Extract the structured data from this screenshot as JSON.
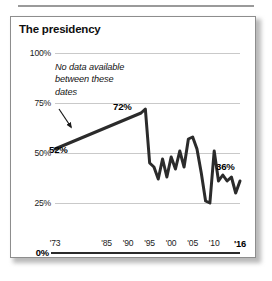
{
  "card": {
    "title": "The presidency"
  },
  "annotation": {
    "text": "No data available between these dates",
    "arrow": "arrow-down-right"
  },
  "chart_data": {
    "type": "line",
    "title": "The presidency",
    "xlabel": "",
    "ylabel": "",
    "ylim": [
      0,
      100
    ],
    "yticks": [
      "0%",
      "25%",
      "50%",
      "75%",
      "100%"
    ],
    "ytick_values": [
      0,
      25,
      50,
      75,
      100
    ],
    "xticks": [
      "'73",
      "'85",
      "'90",
      "'95",
      "'00",
      "'05",
      "'10",
      "'16"
    ],
    "xtick_values": [
      1973,
      1985,
      1990,
      1995,
      2000,
      2005,
      2010,
      2016
    ],
    "xlim": [
      1973,
      2016
    ],
    "grid": true,
    "legend": "none",
    "line_color": "#2b2b2b",
    "gridline_color": "#c9c9c9",
    "annotations": [
      {
        "label": "52%",
        "x": 1973,
        "y": 52
      },
      {
        "label": "72%",
        "x": 1994,
        "y": 72
      },
      {
        "label": "36%",
        "x": 2016,
        "y": 36
      }
    ],
    "gap_note": "No data available between 1973 and 1993",
    "x": [
      1973,
      1993,
      1994,
      1995,
      1996,
      1997,
      1998,
      1999,
      2000,
      2001,
      2002,
      2003,
      2004,
      2005,
      2006,
      2007,
      2008,
      2009,
      2010,
      2011,
      2012,
      2013,
      2014,
      2015,
      2016
    ],
    "values": [
      52,
      70,
      72,
      45,
      43,
      37,
      47,
      38,
      48,
      42,
      51,
      43,
      57,
      58,
      52,
      40,
      26,
      25,
      51,
      36,
      39,
      36,
      38,
      30,
      36
    ],
    "series": [
      {
        "name": "Confidence in the presidency",
        "values": [
          52,
          70,
          72,
          45,
          43,
          37,
          47,
          38,
          48,
          42,
          51,
          43,
          57,
          58,
          52,
          40,
          26,
          25,
          51,
          36,
          39,
          36,
          38,
          30,
          36
        ]
      }
    ]
  },
  "yticks": [
    {
      "label": "100%",
      "value": 100,
      "bold": false
    },
    {
      "label": "75%",
      "value": 75,
      "bold": false
    },
    {
      "label": "50%",
      "value": 50,
      "bold": false
    },
    {
      "label": "25%",
      "value": 25,
      "bold": false
    },
    {
      "label": "0%",
      "value": 0,
      "bold": true
    }
  ],
  "xticks": [
    {
      "label": "'73",
      "value": 1973,
      "bold": false
    },
    {
      "label": "'85",
      "value": 1985,
      "bold": false
    },
    {
      "label": "'90",
      "value": 1990,
      "bold": false
    },
    {
      "label": "'95",
      "value": 1995,
      "bold": false
    },
    {
      "label": "'00",
      "value": 2000,
      "bold": false
    },
    {
      "label": "'05",
      "value": 2005,
      "bold": false
    },
    {
      "label": "'10",
      "value": 2010,
      "bold": false
    },
    {
      "label": "'16",
      "value": 2016,
      "bold": true
    }
  ],
  "data_labels": {
    "start": "52%",
    "peak": "72%",
    "end": "36%"
  }
}
